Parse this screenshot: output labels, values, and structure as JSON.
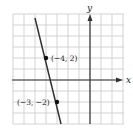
{
  "chart_data": {
    "type": "line",
    "title": "",
    "xlabel": "x",
    "ylabel": "y",
    "xlim": [
      -7,
      3
    ],
    "ylim": [
      -4,
      6
    ],
    "grid": true,
    "grid_step": 1,
    "series": [
      {
        "name": "line",
        "equation": "y = -4x - 14",
        "slope": -4,
        "x": [
          -4.9,
          -2.5
        ],
        "y": [
          5.6,
          -4
        ]
      }
    ],
    "points": [
      {
        "x": -4,
        "y": 2,
        "label": "(−4, 2)"
      },
      {
        "x": -3,
        "y": -2,
        "label": "(−3, −2)"
      }
    ],
    "colors": {
      "grid": "#c8c8c8",
      "axis": "#333333",
      "line": "#333333",
      "point": "#111111"
    }
  },
  "labels": {
    "x_axis": "x",
    "y_axis": "y",
    "point1": "(−4, 2)",
    "point2": "(−3, −2)"
  }
}
